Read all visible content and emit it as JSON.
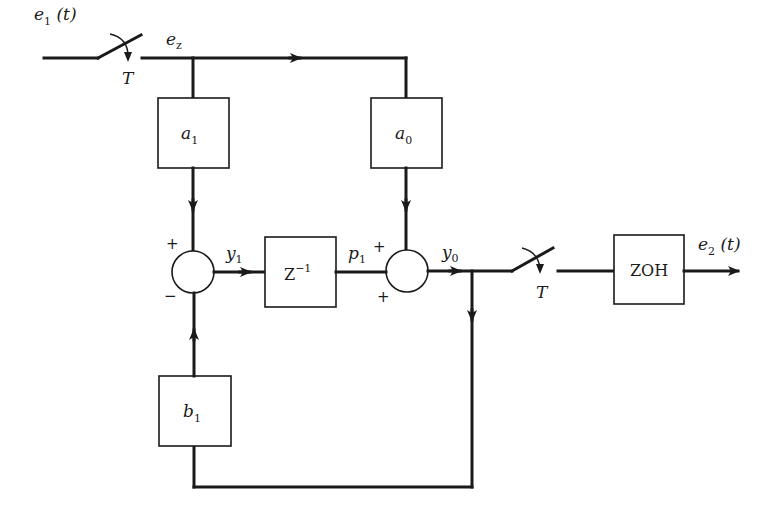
{
  "diagram": {
    "type": "block-diagram",
    "signals": {
      "input": {
        "base": "e",
        "sub": "1",
        "suffix": "(t)"
      },
      "sampled": {
        "base": "e",
        "sub": "z"
      },
      "y1": {
        "base": "y",
        "sub": "1"
      },
      "p1": {
        "base": "p",
        "sub": "1"
      },
      "y0": {
        "base": "y",
        "sub": "0"
      },
      "output": {
        "base": "e",
        "sub": "2",
        "suffix": "(t)"
      }
    },
    "blocks": {
      "a1": {
        "base": "a",
        "sub": "1"
      },
      "a0": {
        "base": "a",
        "sub": "0"
      },
      "b1": {
        "base": "b",
        "sub": "1"
      },
      "delay": {
        "base": "Z",
        "sup": "−1"
      },
      "zoh": {
        "label": "ZOH"
      }
    },
    "samplers": {
      "input_period": "T",
      "output_period": "T"
    },
    "summers": {
      "s1": {
        "top_sign": "+",
        "bottom_sign": "−"
      },
      "s2": {
        "left_sign": "+",
        "bottom_sign": "+"
      }
    }
  }
}
